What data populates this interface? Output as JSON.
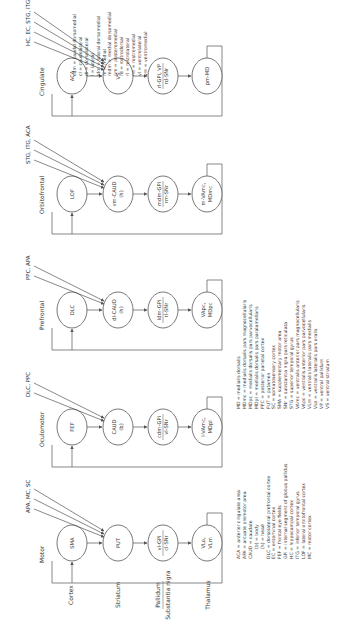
{
  "row_labels": [
    "Cortex",
    "Striatum",
    "Pallidum",
    "Substantia nigra",
    "Thalamus"
  ],
  "circuits": [
    {
      "name": "Motor",
      "cortex": "SMA",
      "inputs": "APA, MC, SC",
      "striatum": [
        "PUT",
        ""
      ],
      "pallidum": [
        "vl-GPi",
        "cl-SNr"
      ],
      "thalamus": [
        "VLo,",
        "VLm"
      ]
    },
    {
      "name": "Oculomotor",
      "cortex": "FEF",
      "inputs": "DLC, PPC",
      "striatum": [
        "CAUD",
        "(b)"
      ],
      "pallidum": [
        "cdm-GPi",
        "vl-SNr"
      ],
      "thalamus": [
        "l-VAmc,",
        "MDpl"
      ]
    },
    {
      "name": "Prefrontal",
      "cortex": "DLC",
      "inputs": "PPC, APA",
      "striatum": [
        "dl-CAUD",
        "(h)"
      ],
      "pallidum": [
        "ldm-GPi",
        "rl-SNr"
      ],
      "thalamus": [
        "VApc,",
        "MDpc"
      ]
    },
    {
      "name": "Orbitofrontal",
      "cortex": "LOF",
      "inputs": "STG, ITG, ACA",
      "striatum": [
        "vm-CAUD",
        "(h)"
      ],
      "pallidum": [
        "mdm-GPi",
        "rm-SNr"
      ],
      "thalamus": [
        "m-VAmc,",
        "MDmc"
      ]
    },
    {
      "name": "Cingulate",
      "cortex": "ACA",
      "inputs": "HC, EC, STG, ITG",
      "striatum": [
        "VS",
        ""
      ],
      "pallidum": [
        "rl-GPi, VP",
        "rd-SNr"
      ],
      "thalamus": [
        "pm-MD",
        ""
      ]
    }
  ],
  "legend_1": [
    "ACA = anterior cingulate area",
    "APA = arcuate premotor area",
    "CAUD = caudate",
    "(b) = body",
    "(h) = head",
    "DLC = dorsolateral prefrontal cortex",
    "EC = entorhinal cortex",
    "FEF = frontal eye fields",
    "GPi = internal segment of globus pallidus",
    "HC = hippocampal cortex",
    "ITG = inferior temporal gyrus",
    "LOF = lateral orbitofrontal cortex",
    "MC = motor cortex"
  ],
  "legend_2": [
    "MD = medialis dorsalis",
    "MDmc = medialis dorsalis pars magnocellularis",
    "MDpc = medialis dorsalis pars parvocellularis",
    "MDpl = medialis dorsalis pars paralamellaris",
    "PPC = posterior parietal cortex",
    "PUT = putamen",
    "SC = somatosensory cortex",
    "SMA = supplementary motor area",
    "SNr = substantia nigra pars reticulata",
    "STG = superior temporal gyrus",
    "VAmc = ventralis anterior pars magnocellularis",
    "VApc = ventralis anterior pars parvocellularis",
    "VLm = ventralis lateralis pars medialis",
    "VLo = ventralis lateralis pars oralis",
    "VP = ventral pallidum",
    "VS = ventral striatum"
  ],
  "legend_3": [
    "cdm = caudal dorsomedial",
    "cl = caudolateral",
    "dl = dorsolateral",
    "l = lateral",
    "ldm = lateral dorsomedial",
    "m = medial",
    "mdm = medial dorsomedial",
    "pm = posteromedial",
    "rd = rostrodorsal",
    "rl = rostrolateral",
    "rm = rostromedial",
    "vl = ventrolateral",
    "vm = ventromedial"
  ]
}
